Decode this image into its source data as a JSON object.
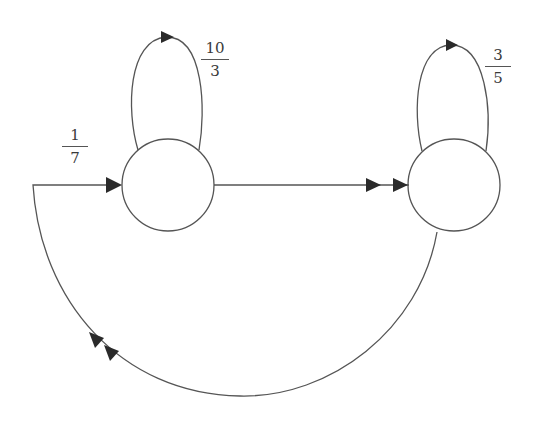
{
  "diagram": {
    "type": "state-transition-graph",
    "colors": {
      "stroke": "#555555",
      "arrow": "#2a2a2a",
      "background": "#ffffff"
    },
    "nodes": [
      {
        "id": "left-state",
        "cx": 168,
        "cy": 185,
        "r": 46
      },
      {
        "id": "right-state",
        "cx": 454,
        "cy": 185,
        "r": 46
      }
    ],
    "edges": [
      {
        "id": "left-self-loop",
        "from": "left-state",
        "to": "left-state",
        "label": {
          "numerator": "10",
          "denominator": "3"
        }
      },
      {
        "id": "right-self-loop",
        "from": "right-state",
        "to": "right-state",
        "label": {
          "numerator": "3",
          "denominator": "5"
        }
      },
      {
        "id": "left-to-right",
        "from": "left-state",
        "to": "right-state",
        "arrowheads": 2
      },
      {
        "id": "right-to-left-return",
        "from": "right-state",
        "to": "left-state",
        "arrowheads": 3,
        "label": {
          "numerator": "1",
          "denominator": "7"
        }
      }
    ]
  },
  "labels": {
    "left_loop": {
      "numerator": "10",
      "denominator": "3"
    },
    "right_loop": {
      "numerator": "3",
      "denominator": "5"
    },
    "return_edge": {
      "numerator": "1",
      "denominator": "7"
    }
  }
}
